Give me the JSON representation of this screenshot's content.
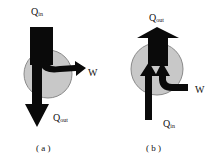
{
  "panels": [
    {
      "id": "a",
      "caption": "( a )",
      "labels": {
        "q_in": "Q",
        "q_in_sub": "in",
        "work": "W",
        "q_out": "Q",
        "q_out_sub": "out"
      },
      "description": "Heat engine: heat in from top, work out to right, heat out downward"
    },
    {
      "id": "b",
      "caption": "( b )",
      "labels": {
        "q_out": "Q",
        "q_out_sub": "out",
        "work": "W",
        "q_in": "Q",
        "q_in_sub": "in"
      },
      "description": "Heat pump: heat in from bottom plus work in from right, heat out upward"
    }
  ],
  "colors": {
    "circle_fill": "#c8c8c8",
    "circle_stroke": "#8a8a8a",
    "arrow": "#0a0a0a",
    "background": "#ffffff"
  }
}
